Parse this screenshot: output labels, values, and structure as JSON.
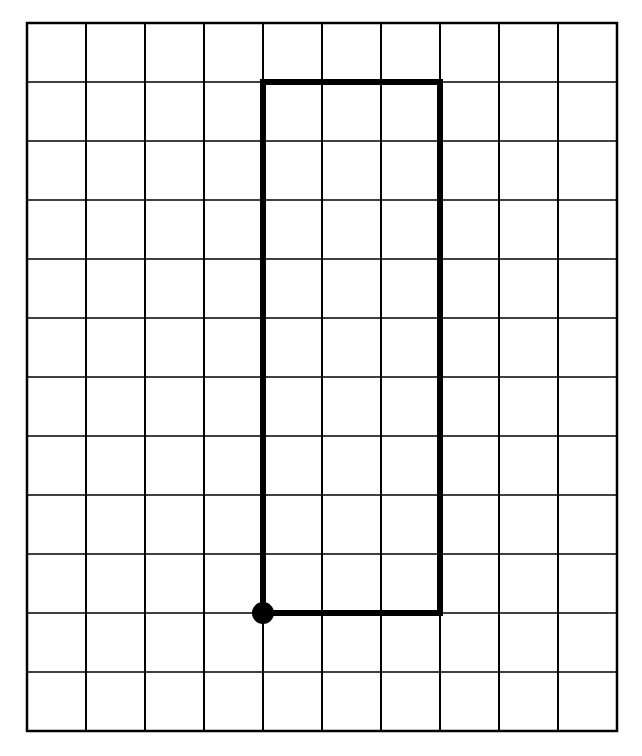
{
  "diagram": {
    "grid": {
      "columns": 10,
      "rows": 12,
      "origin_px": [
        27,
        23
      ],
      "cell_w": 59,
      "cell_h": 59,
      "line_color": "#000000"
    },
    "rectangle": {
      "col_start": 4,
      "col_end": 7,
      "row_start": 1,
      "row_end": 10,
      "width_units": 3,
      "height_units": 9,
      "stroke_color": "#000000"
    },
    "start_point": {
      "col": 4,
      "row": 10,
      "color": "#000000"
    }
  }
}
